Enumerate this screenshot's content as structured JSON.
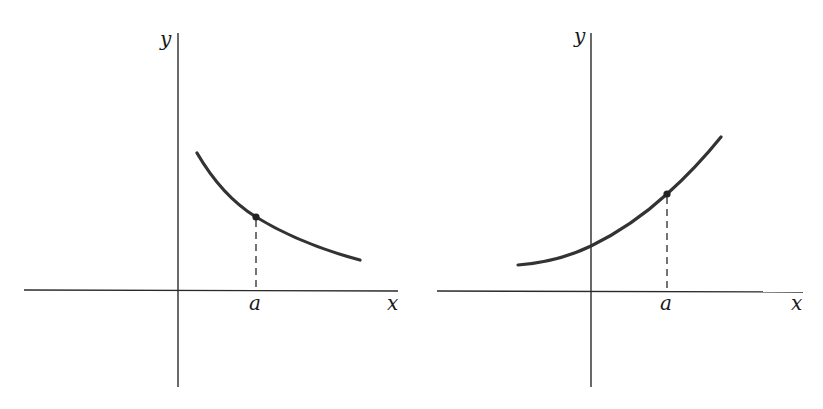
{
  "figures": [
    {
      "id": "left",
      "description": "decreasing curve with marked point at x = a",
      "labels": {
        "y_axis": "y",
        "x_axis": "x",
        "point": "a"
      },
      "trend": "decreasing"
    },
    {
      "id": "right",
      "description": "increasing curve with marked point at x = a",
      "labels": {
        "y_axis": "y",
        "x_axis": "x",
        "point": "a"
      },
      "trend": "increasing"
    }
  ],
  "colors": {
    "background": "#ffffff",
    "ink": "#2a2a2a",
    "curve": "#333333"
  }
}
